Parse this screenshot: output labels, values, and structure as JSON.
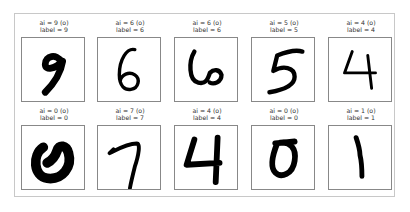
{
  "figure": {
    "panels": [
      {
        "ai": "ai = 9 (o)",
        "label": "label = 9",
        "digit": "9"
      },
      {
        "ai": "ai = 6 (o)",
        "label": "label = 6",
        "digit": "6"
      },
      {
        "ai": "ai = 6 (o)",
        "label": "label = 6",
        "digit": "6"
      },
      {
        "ai": "ai = 5 (o)",
        "label": "label = 5",
        "digit": "5"
      },
      {
        "ai": "ai = 4 (o)",
        "label": "label = 4",
        "digit": "4"
      },
      {
        "ai": "ai = 0 (o)",
        "label": "label = 0",
        "digit": "0"
      },
      {
        "ai": "ai = 7 (o)",
        "label": "label = 7",
        "digit": "7"
      },
      {
        "ai": "ai = 4 (o)",
        "label": "label = 4",
        "digit": "4"
      },
      {
        "ai": "ai = 0 (o)",
        "label": "label = 0",
        "digit": "0"
      },
      {
        "ai": "ai = 1 (o)",
        "label": "label = 1",
        "digit": "1"
      }
    ]
  }
}
